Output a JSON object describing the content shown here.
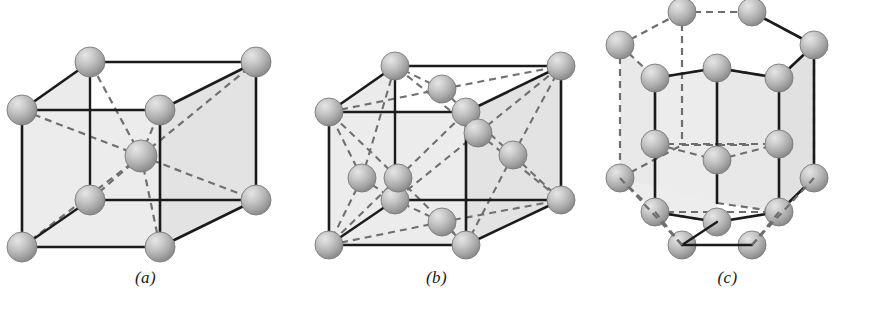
{
  "figure": {
    "background_color": "#ffffff",
    "panels": [
      {
        "id": "a",
        "caption": "(a)",
        "structure": "body-centered cubic",
        "atom_count": 9
      },
      {
        "id": "b",
        "caption": "(b)",
        "structure": "face-centered cubic",
        "atom_count": 14
      },
      {
        "id": "c",
        "caption": "(c)",
        "structure": "hexagonal close-packed",
        "atom_count": 17
      }
    ]
  },
  "style": {
    "line_color": "#1b1b1b",
    "dash_color": "#6e6e6e",
    "face_fill": "#ebebeb",
    "face_fill_dark": "#e2e2e2",
    "sphere_light": "#d8d8d8",
    "sphere_mid": "#b3b3b3",
    "sphere_dark": "#8d8d8d",
    "sphere_outline": "#6f6f6f",
    "caption_color": "#1a1a1a"
  },
  "geometry": {
    "a": {
      "front": [
        [
          22,
          110
        ],
        [
          22,
          247
        ],
        [
          160,
          247
        ],
        [
          160,
          110
        ]
      ],
      "back": [
        [
          90,
          62
        ],
        [
          90,
          200
        ],
        [
          256,
          200
        ],
        [
          256,
          62
        ]
      ],
      "center": [
        141,
        156
      ],
      "radius": 15
    },
    "b": {
      "front": [
        [
          330,
          110
        ],
        [
          330,
          247
        ],
        [
          468,
          247
        ],
        [
          468,
          110
        ]
      ],
      "back": [
        [
          398,
          62
        ],
        [
          398,
          200
        ],
        [
          564,
          200
        ],
        [
          564,
          62
        ]
      ],
      "radius": 14
    },
    "c": {
      "radius": 14
    }
  }
}
